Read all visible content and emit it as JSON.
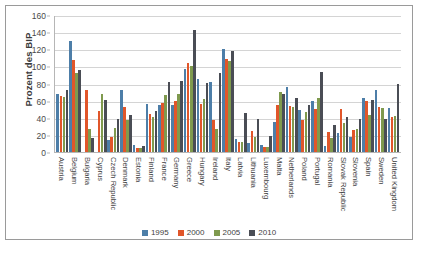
{
  "chart_data": {
    "type": "bar",
    "title": "",
    "xlabel": "",
    "ylabel": "Prozent des BIP",
    "ylim": [
      0,
      160
    ],
    "yticks": [
      0,
      20,
      40,
      60,
      80,
      100,
      120,
      140,
      160
    ],
    "grid": true,
    "legend_position": "bottom",
    "categories": [
      "Austria",
      "Belgium",
      "Bulgaria",
      "Cyprus",
      "Czech Republic",
      "Denmark",
      "Estonia",
      "Finland",
      "France",
      "Germany",
      "Greece",
      "Hungary",
      "Ireland",
      "Italy",
      "Latvia",
      "Lithuania",
      "Luxembourg",
      "Malta",
      "Netherlands",
      "Poland",
      "Portugal",
      "Romania",
      "Slovak Republic",
      "Slovenia",
      "Spain",
      "Sweden",
      "United Kingdom"
    ],
    "series": [
      {
        "name": "1995",
        "color": "#4d7ea8",
        "values": [
          68,
          130,
          0,
          0,
          14,
          72,
          8,
          56,
          55,
          55,
          97,
          85,
          82,
          120,
          15,
          11,
          8,
          35,
          76,
          49,
          59,
          7,
          22,
          18,
          63,
          72,
          51
        ]
      },
      {
        "name": "2000",
        "color": "#e1562a",
        "values": [
          66,
          107,
          72,
          48,
          18,
          52,
          5,
          44,
          57,
          60,
          104,
          56,
          37,
          109,
          12,
          24,
          6,
          55,
          54,
          37,
          50,
          23,
          50,
          26,
          59,
          53,
          41
        ]
      },
      {
        "name": "2005",
        "color": "#7f9a4e",
        "values": [
          64,
          92,
          27,
          68,
          28,
          37,
          5,
          41,
          67,
          68,
          101,
          62,
          27,
          106,
          12,
          18,
          6,
          70,
          52,
          47,
          63,
          16,
          34,
          27,
          43,
          51,
          42
        ]
      },
      {
        "name": "2010",
        "color": "#4a4d55",
        "values": [
          72,
          96,
          16,
          61,
          38,
          43,
          7,
          48,
          82,
          83,
          142,
          81,
          92,
          118,
          45,
          38,
          19,
          68,
          63,
          55,
          94,
          31,
          41,
          39,
          61,
          39,
          80
        ]
      }
    ]
  },
  "legend": {
    "entries": [
      {
        "label": "1995"
      },
      {
        "label": "2000"
      },
      {
        "label": "2005"
      },
      {
        "label": "2010"
      }
    ]
  },
  "caption": {
    "text": ""
  }
}
